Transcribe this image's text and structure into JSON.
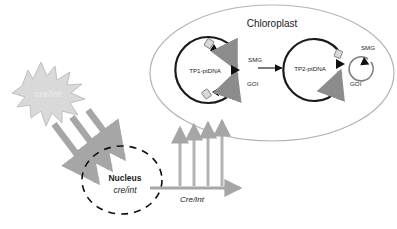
{
  "diagram": {
    "title_visible": false,
    "type": "biological-schematic",
    "colors": {
      "chloroplast_outline": "#b3b3b3",
      "plasmid_stroke": "#1a1a1a",
      "small_circle_stroke": "#808080",
      "gray_arrow": "#a6a6a6",
      "gray_arrow_dark": "#8c8c8c",
      "star_fill": "#d9d9d9",
      "star_stroke": "#bfbfbf",
      "star_text": "#e0e0e0",
      "nucleus_dashed": "#111111",
      "text": "#1a1a1a",
      "site_box_fill": "#d9d9d9",
      "site_box_stroke": "#808080",
      "triangle_fill": "#111111"
    }
  },
  "chloroplast": {
    "label": "Chloroplast"
  },
  "plasmid_left": {
    "name": "TP1-ptDNA",
    "marker_upper": "SMG",
    "marker_lower": "GOI"
  },
  "plasmid_right": {
    "name": "TP2-ptDNA",
    "marker_lower": "GOI"
  },
  "excised_circle": {
    "label": "SMG"
  },
  "nucleus": {
    "label": "Nucleus",
    "gene_label": "cre/int"
  },
  "star": {
    "label": "cre/int"
  },
  "transport_arrow": {
    "label": "Cre/Int"
  },
  "arrows": {
    "conversion_arrow_name": "recombination-arrow",
    "import_arrow_count": 4,
    "nuclear_arrow_count": 3
  }
}
